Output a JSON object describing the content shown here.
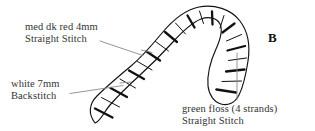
{
  "figure": {
    "letter": "B",
    "background_color": "#ffffff",
    "ink_color": "#111111",
    "leader_line_color": "#808080",
    "text_color": "#333333"
  },
  "annotations": {
    "red": {
      "line1": "med dk red  4mm",
      "line2": "Straight Stitch"
    },
    "white": {
      "line1": "white  7mm",
      "line2": "Backstitch"
    },
    "green": {
      "line1": "green floss (4 strands)",
      "line2": "Straight Stitch"
    }
  }
}
